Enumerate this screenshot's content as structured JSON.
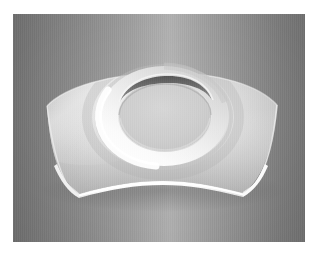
{
  "page": {
    "width": 322,
    "height": 256,
    "background_color": "#ffffff",
    "margin_color": "#ffffff",
    "caption": ""
  },
  "scene": {
    "name": "grayscale-3d-render",
    "x": 13,
    "y": 14,
    "width": 292,
    "height": 228,
    "background_type": "horizontal-gradient",
    "background_gradient_stops": [
      {
        "position": "0%",
        "color": "#6f6f6f"
      },
      {
        "position": "14%",
        "color": "#7e7e7e"
      },
      {
        "position": "26%",
        "color": "#8a8a8a"
      },
      {
        "position": "38%",
        "color": "#989898"
      },
      {
        "position": "48%",
        "color": "#a6a6a6"
      },
      {
        "position": "54%",
        "color": "#adadad"
      },
      {
        "position": "72%",
        "color": "#939393"
      },
      {
        "position": "91%",
        "color": "#7a7a7a"
      },
      {
        "position": "100%",
        "color": "#717171"
      }
    ],
    "has_scanline_texture": true
  },
  "object": {
    "name": "curved-saddle-plate-with-circular-boss",
    "description": "Shaded 3D CAD render of a doubly-curved (saddle) rectangular panel with a raised circular ring boss at its center",
    "shading": "smooth-gouraud-grayscale",
    "surface_colors": {
      "body_light": "#e4e4e4",
      "body_mid": "#cfcfcf",
      "body_shadow": "#b4b4b4",
      "body_deep_shadow": "#9b9b9b",
      "edge_highlight": "#fdfdfd",
      "ring_highlight": "#f6f6f6",
      "ring_mid": "#dcdcdc",
      "inner_disc": "#c9c9c9",
      "inner_wall_dark": "#5c5c5c",
      "inner_wall_darkest": "#4a4a4a"
    },
    "features": [
      {
        "name": "top-edge-arc",
        "type": "convex-arc",
        "description": "Gently convex upper silhouette peaking near the horizontal center"
      },
      {
        "name": "bottom-edge-arc",
        "type": "concave-arc",
        "description": "Strongly concave lower silhouette forming the saddle sweep"
      },
      {
        "name": "left-corner-tip",
        "type": "vertex",
        "x": 47,
        "y": 186
      },
      {
        "name": "right-corner-tip",
        "type": "vertex",
        "x": 277,
        "y": 186
      },
      {
        "name": "bottom-edge-highlight",
        "type": "specular-band",
        "description": "Bright white band revealing panel thickness along the lower rim"
      },
      {
        "name": "circular-boss-ring",
        "type": "annulus",
        "center_x": 164,
        "center_y": 116,
        "outer_rx": 64,
        "outer_ry": 48,
        "inner_rx": 47,
        "inner_ry": 35
      },
      {
        "name": "boss-inner-wall-crescent",
        "type": "dark-crescent",
        "description": "Dark arc at the top inner wall of the boss showing its depth"
      },
      {
        "name": "boss-inner-disc",
        "type": "ellipse",
        "description": "Flat light-gray disc recessed inside the ring"
      }
    ]
  }
}
